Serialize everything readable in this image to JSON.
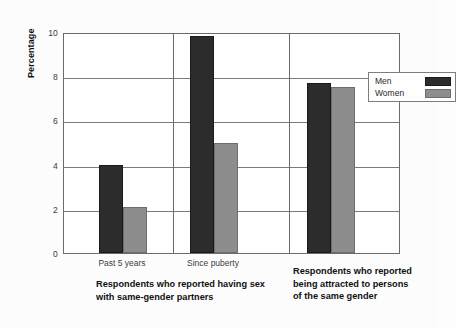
{
  "chart_data": {
    "type": "bar",
    "title": "",
    "xlabel": "",
    "ylabel": "Percentage",
    "ylim": [
      0,
      10
    ],
    "yticks": [
      0,
      2,
      4,
      6,
      8,
      10
    ],
    "grid": true,
    "legend_position": "inside top-right",
    "categories": [
      "Past 5 years",
      "Since puberty",
      "Respondents who reported being attracted to persons of the same gender"
    ],
    "tick_labels": [
      "Past 5 years",
      "Since puberty",
      ""
    ],
    "series": [
      {
        "name": "Men",
        "color": "#2c2c2c",
        "values": [
          4.0,
          9.8,
          7.7
        ]
      },
      {
        "name": "Women",
        "color": "#8d8d8d",
        "values": [
          2.1,
          5.0,
          7.5
        ]
      }
    ],
    "group_captions": [
      "Respondents who reported having sex with same-gender partners",
      "Respondents who reported being attracted to persons of the same gender"
    ]
  },
  "axis": {
    "y_title": "Percentage",
    "y_tick_0": "0",
    "y_tick_1": "2",
    "y_tick_2": "4",
    "y_tick_3": "6",
    "y_tick_4": "8",
    "y_tick_5": "10"
  },
  "xlabels": {
    "group1": "Past 5 years",
    "group2": "Since puberty"
  },
  "captions": {
    "left_line1": "Respondents who reported having sex",
    "left_line2": "with same-gender partners",
    "right_line1": "Respondents who reported",
    "right_line2": "being attracted to persons",
    "right_line3": "of the same gender"
  },
  "legend": {
    "men_label": "Men",
    "women_label": "Women"
  }
}
